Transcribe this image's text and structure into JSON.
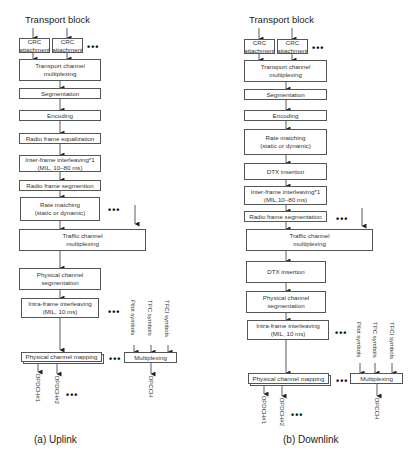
{
  "uplink": {
    "title": "Transport block",
    "crc1": [
      "CRC",
      "attachment"
    ],
    "crc2": [
      "CRC",
      "attachment"
    ],
    "steps": {
      "tcm": [
        "Transport channel",
        "multiplexing"
      ],
      "seg": "Segmentation",
      "enc": "Encoding",
      "rfe": "Radio frame equalization",
      "ifi": [
        "Inter-frame interleaving*1",
        "(MIL, 10–80 ms)"
      ],
      "rfs": "Radio frame segmention",
      "rm": [
        "Rate matching",
        "(static or dynamic)"
      ],
      "trcm": [
        "Traffic channel",
        "multiplexing"
      ],
      "pcs": [
        "Physical channel",
        "segmentation"
      ],
      "intra": [
        "Intra-frame interleaving",
        "(MIL, 10 ms)"
      ],
      "pcm": "Physical channel mapping",
      "mux": "Multiplexing"
    },
    "inputs": [
      "Pilot symbols",
      "TPC symbols",
      "TFCI symbols"
    ],
    "outputs": [
      "DPDCH#1",
      "DPDCH#2",
      "DPCCH"
    ],
    "caption": "(a) Uplink"
  },
  "downlink": {
    "title": "Transport block",
    "crc1": [
      "CRC",
      "attachment"
    ],
    "crc2": [
      "CRC",
      "attachment"
    ],
    "steps": {
      "tcm": [
        "Transport channel",
        "multiplexing"
      ],
      "seg": "Segmentation",
      "enc": "Encoding",
      "rm": [
        "Rate matching",
        "(static or dynamic)"
      ],
      "dtx1": "DTX insertion",
      "ifi": [
        "Inter-frame interleaving*1",
        "(MIL,10–80 ms)"
      ],
      "rfs": "Radio frame segmentation",
      "trcm": [
        "Traffic channel",
        "multiplexing"
      ],
      "dtx2": "DTX insertion",
      "pcs": [
        "Physical channel",
        "segmentation"
      ],
      "intra": [
        "Intra-frame interleaving",
        "(MIL, 10 ms)"
      ],
      "pcm": "Physical channel mapping",
      "mux": "Multiplexing"
    },
    "inputs": [
      "Pilot symbols",
      "TPC symbols",
      "TFCI symbols"
    ],
    "outputs": [
      "DPDCH#1",
      "DPDCH#2",
      "DPCCH"
    ],
    "caption": "(b) Downlink"
  },
  "ellipsis": "•••"
}
